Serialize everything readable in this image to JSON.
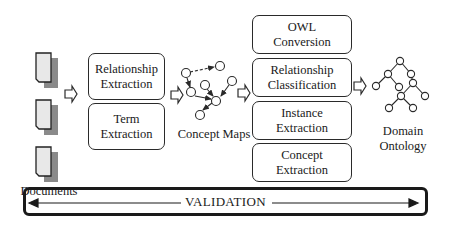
{
  "diagram": {
    "documents": {
      "label": "Documents",
      "icon": "document-stack-icon",
      "count": 3
    },
    "extraction_stage": {
      "boxes": [
        {
          "label_line1": "Relationship",
          "label_line2": "Extraction"
        },
        {
          "label_line1": "Term",
          "label_line2": "Extraction"
        }
      ]
    },
    "concept_maps": {
      "label": "Concept Maps",
      "icon": "concept-map-graph-icon"
    },
    "processing_stage": {
      "boxes": [
        {
          "label_line1": "OWL",
          "label_line2": "Conversion"
        },
        {
          "label_line1": "Relationship",
          "label_line2": "Classification"
        },
        {
          "label_line1": "Instance",
          "label_line2": "Extraction"
        },
        {
          "label_line1": "Concept",
          "label_line2": "Extraction"
        }
      ]
    },
    "ontology": {
      "label_line1": "Domain",
      "label_line2": "Ontology",
      "icon": "tree-hierarchy-icon"
    },
    "validation": {
      "label": "VALIDATION",
      "direction": "bidirectional"
    }
  },
  "colors": {
    "stroke": "#2a2a2a",
    "shadow": "#8a8a8a",
    "page": "#e8e8e8",
    "background": "#ffffff"
  }
}
